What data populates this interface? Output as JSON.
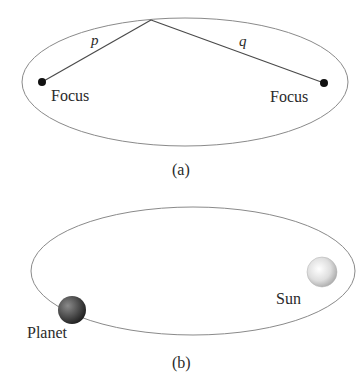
{
  "panel_a": {
    "caption": "(a)",
    "segment_left_label": "p",
    "segment_right_label": "q",
    "focus_left_label": "Focus",
    "focus_right_label": "Focus",
    "colors": {
      "ellipse": "#8a8a8a",
      "segments": "#4a4a4a",
      "focus_dot": "#111111"
    }
  },
  "panel_b": {
    "caption": "(b)",
    "planet_label": "Planet",
    "sun_label": "Sun",
    "colors": {
      "orbit": "#8a8a8a",
      "planet": "#4a4a4a",
      "sun": "#d8d8d8"
    }
  }
}
